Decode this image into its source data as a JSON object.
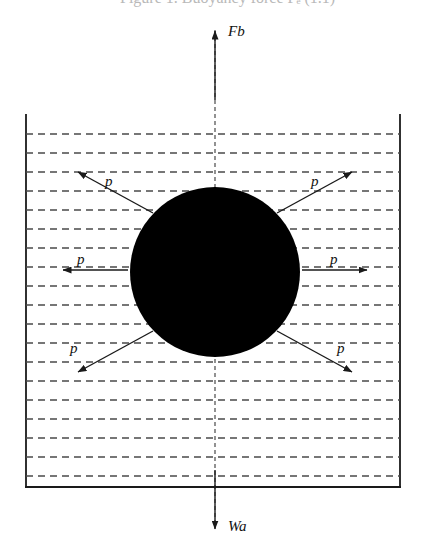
{
  "figure": {
    "title_partial": "Figure 1. Buoyancy force Fₑ (1.1)",
    "background_color": "#ffffff",
    "stroke_color": "#1a1a1a",
    "body_fill_color": "#000000",
    "container": {
      "name": "fluid-container",
      "left_wall_x": 26,
      "right_wall_x": 400,
      "bottom_y": 487,
      "top_open": true
    },
    "fluid": {
      "name": "fluid-level-lines",
      "line_style": "dashed",
      "line_count": 19,
      "first_line_y": 134,
      "spacing": 19,
      "x_start": 26,
      "x_end": 400
    },
    "body": {
      "name": "submerged-sphere",
      "shape": "circle",
      "center_x": 215,
      "center_y": 272,
      "radius": 85,
      "fill": "#000000"
    },
    "axis": {
      "name": "vertical-axis",
      "style": "dashed",
      "x": 215,
      "top_y": 30,
      "bottom_y": 528
    },
    "vectors": [
      {
        "id": "buoyancy",
        "label": "Fb",
        "direction": "up",
        "x1": 215,
        "y1": 100,
        "x2": 215,
        "y2": 31,
        "label_x": 228,
        "label_y": 36
      },
      {
        "id": "weight",
        "label": "Wa",
        "direction": "down",
        "x1": 215,
        "y1": 470,
        "x2": 215,
        "y2": 529,
        "label_x": 228,
        "label_y": 531
      },
      {
        "id": "pressure-left",
        "label": "p",
        "direction": "left",
        "x1": 128,
        "y1": 270,
        "x2": 63,
        "y2": 270,
        "label_x": 77,
        "label_y": 264
      },
      {
        "id": "pressure-right",
        "label": "p",
        "direction": "right",
        "x1": 302,
        "y1": 270,
        "x2": 367,
        "y2": 270,
        "label_x": 330,
        "label_y": 264
      },
      {
        "id": "pressure-upper-left",
        "label": "p",
        "direction": "up-left",
        "x1": 153,
        "y1": 213,
        "x2": 78,
        "y2": 172,
        "label_x": 105,
        "label_y": 186
      },
      {
        "id": "pressure-upper-right",
        "label": "p",
        "direction": "up-right",
        "x1": 277,
        "y1": 213,
        "x2": 352,
        "y2": 172,
        "label_x": 311,
        "label_y": 186
      },
      {
        "id": "pressure-lower-left",
        "label": "p",
        "direction": "down-left",
        "x1": 153,
        "y1": 331,
        "x2": 78,
        "y2": 372,
        "label_x": 70,
        "label_y": 353
      },
      {
        "id": "pressure-lower-right",
        "label": "p",
        "direction": "down-right",
        "x1": 277,
        "y1": 331,
        "x2": 352,
        "y2": 372,
        "label_x": 337,
        "label_y": 353
      }
    ]
  }
}
